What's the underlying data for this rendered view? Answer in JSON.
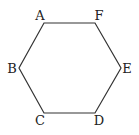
{
  "diagram": {
    "type": "hexagon",
    "stroke_color": "#333333",
    "vertices": [
      {
        "label": "A",
        "x": 44,
        "y": 23,
        "lx": 40,
        "ly": 20
      },
      {
        "label": "F",
        "x": 95,
        "y": 23,
        "lx": 99,
        "ly": 20
      },
      {
        "label": "E",
        "x": 121,
        "y": 68,
        "lx": 127,
        "ly": 73
      },
      {
        "label": "D",
        "x": 95,
        "y": 113,
        "lx": 99,
        "ly": 125
      },
      {
        "label": "C",
        "x": 44,
        "y": 113,
        "lx": 40,
        "ly": 125
      },
      {
        "label": "B",
        "x": 19,
        "y": 68,
        "lx": 12,
        "ly": 73
      }
    ]
  }
}
